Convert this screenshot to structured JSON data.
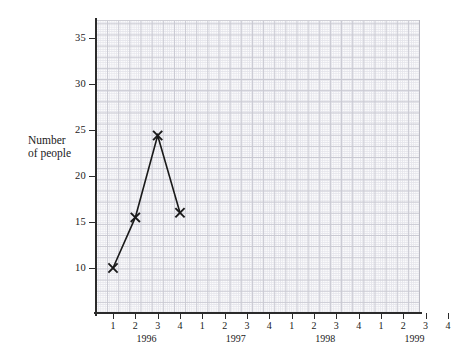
{
  "chart_data": {
    "type": "line",
    "title": "",
    "xlabel": "",
    "ylabel": "Number of people",
    "ylabel_lines": [
      "Number",
      "of people"
    ],
    "ylim": [
      0,
      37.5
    ],
    "ytick_values": [
      5,
      10,
      15,
      20,
      25,
      30,
      35
    ],
    "ytick_labels": [
      "5",
      "10",
      "15",
      "20",
      "25",
      "30",
      "35"
    ],
    "grid": true,
    "grid_style": "graph-paper",
    "legend": "none",
    "x_quarter_labels": [
      "1",
      "2",
      "3",
      "4"
    ],
    "x_year_labels": [
      "1996",
      "1997",
      "1998",
      "1999"
    ],
    "x_categories": [
      "1996 Q1",
      "1996 Q2",
      "1996 Q3",
      "1996 Q4",
      "1997 Q1",
      "1997 Q2",
      "1997 Q3",
      "1997 Q4",
      "1998 Q1",
      "1998 Q2",
      "1998 Q3",
      "1998 Q4",
      "1999 Q1",
      "1999 Q2",
      "1999 Q3",
      "1999 Q4"
    ],
    "series": [
      {
        "name": "Number of people",
        "marker": "x",
        "color": "#1a1a1a",
        "x": [
          "1996 Q1",
          "1996 Q2",
          "1996 Q3",
          "1996 Q4"
        ],
        "values": [
          5,
          10.5,
          19.4,
          11
        ]
      }
    ]
  },
  "axis": {
    "y_title_line1": "Number",
    "y_title_line2": "of people",
    "y_labels": [
      "35",
      "30",
      "25",
      "20",
      "15",
      "10",
      "5"
    ],
    "x_quarters": [
      "1",
      "2",
      "3",
      "4",
      "1",
      "2",
      "3",
      "4",
      "1",
      "2",
      "3",
      "4",
      "1",
      "2",
      "3",
      "4"
    ],
    "x_years": [
      "1996",
      "1997",
      "1998",
      "1999"
    ]
  },
  "colors": {
    "line": "#1a1a1a",
    "marker": "#1a1a1a",
    "axis": "#2b2b2b",
    "grid_minor": "#e6e6ec",
    "grid_major": "#c9c9d2",
    "plot_background": "#fbfbfc",
    "page_background": "#ffffff"
  }
}
